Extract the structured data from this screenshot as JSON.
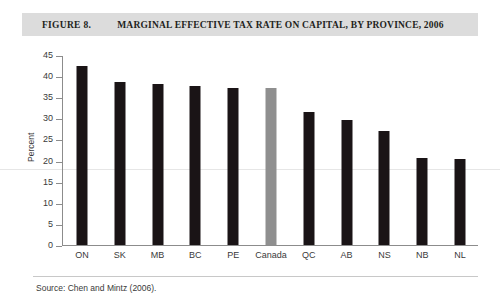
{
  "figure": {
    "number": "FIGURE 8.",
    "title": "MARGINAL EFFECTIVE TAX RATE ON CAPITAL, BY PROVINCE, 2006",
    "source": "Source: Chen and Mintz (2006)."
  },
  "chart_data": {
    "type": "bar",
    "title": "MARGINAL EFFECTIVE TAX RATE ON CAPITAL, BY PROVINCE, 2006",
    "xlabel": "",
    "ylabel": "Percent",
    "ylim": [
      0,
      45
    ],
    "yticks": [
      0,
      5,
      10,
      15,
      20,
      25,
      30,
      35,
      40,
      45
    ],
    "grid": false,
    "legend": null,
    "categories": [
      "ON",
      "SK",
      "MB",
      "BC",
      "PE",
      "Canada",
      "QC",
      "AB",
      "NS",
      "NB",
      "NL"
    ],
    "values": [
      42.4,
      38.5,
      38.2,
      37.7,
      37.2,
      37.1,
      31.4,
      29.7,
      26.9,
      20.6,
      20.3
    ],
    "bar_colors": [
      "#1a1416",
      "#1a1416",
      "#1a1416",
      "#1a1416",
      "#1a1416",
      "#8f8f8f",
      "#1a1416",
      "#1a1416",
      "#1a1416",
      "#1a1416",
      "#1a1416"
    ],
    "highlight_category": "Canada"
  },
  "colors": {
    "bar": "#1a1416",
    "highlight_bar": "#8f8f8f",
    "title_band": "#dcdcdc",
    "axis": "#8c8c8c"
  }
}
